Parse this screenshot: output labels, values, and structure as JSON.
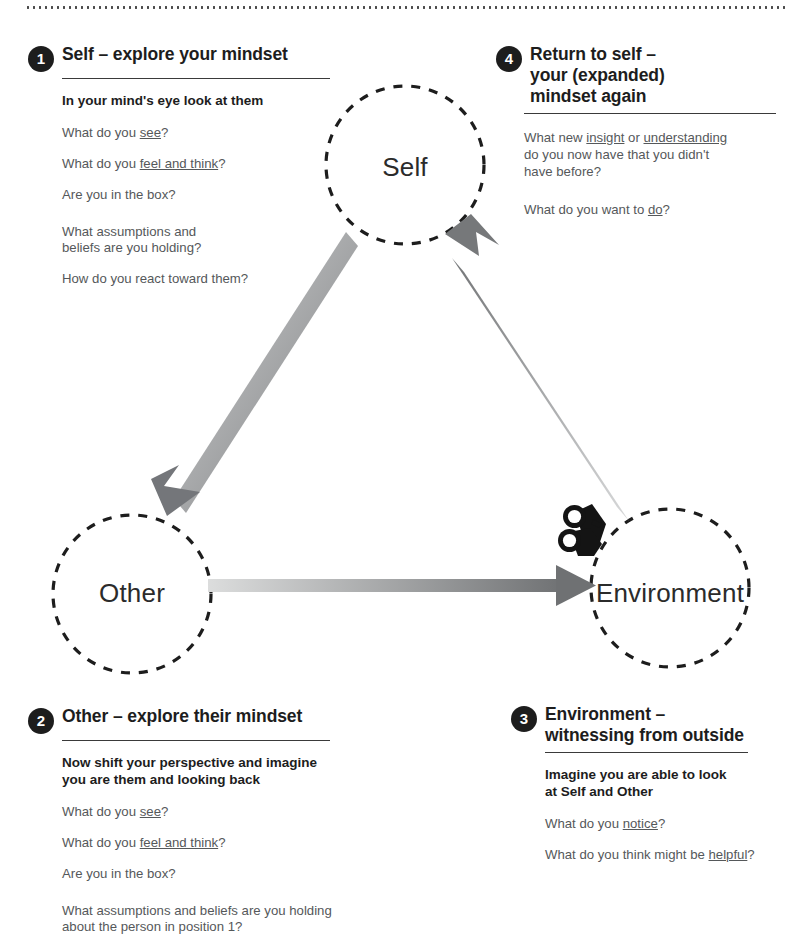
{
  "decor": {
    "top_rule": "dotted-divider"
  },
  "colors": {
    "ink": "#1d1d1d",
    "body_text": "#55585a",
    "node_text": "#2b2b2b",
    "badge_bg": "#1d1d1d",
    "arrow_light": "#d2d3d4",
    "arrow_dark": "#6f7173",
    "circle_stroke": "#1d1d1d"
  },
  "nodes": [
    {
      "id": "self",
      "label": "Self"
    },
    {
      "id": "other",
      "label": "Other"
    },
    {
      "id": "environment",
      "label": "Environment"
    }
  ],
  "arrows": [
    {
      "id": "self-to-other",
      "from": "Self",
      "to": "Other"
    },
    {
      "id": "other-to-environment",
      "from": "Other",
      "to": "Environment"
    },
    {
      "id": "environment-to-self",
      "from": "Environment",
      "to": "Self"
    }
  ],
  "icons": {
    "observer": "binoculars-icon"
  },
  "panels": {
    "p1": {
      "number": "1",
      "title": "Self – explore your mindset",
      "lede": "In your mind's eye look at them",
      "questions": [
        {
          "pre": "What do you ",
          "em": "see",
          "post": "?"
        },
        {
          "pre": "What do you ",
          "em": "feel and think",
          "post": "?"
        },
        {
          "pre": "Are you in the box?",
          "em": "",
          "post": ""
        },
        {
          "pre": "What assumptions and\nbeliefs are you holding?",
          "em": "",
          "post": ""
        },
        {
          "pre": "How do you react toward them?",
          "em": "",
          "post": ""
        }
      ]
    },
    "p2": {
      "number": "2",
      "title": "Other – explore their mindset",
      "lede": "Now shift your perspective and imagine\nyou are them and looking back",
      "questions": [
        {
          "pre": "What do you ",
          "em": "see",
          "post": "?"
        },
        {
          "pre": "What do you ",
          "em": "feel and think",
          "post": "?"
        },
        {
          "pre": "Are you in the box?",
          "em": "",
          "post": ""
        },
        {
          "pre": "What assumptions and beliefs are you holding\nabout the person in position 1?",
          "em": "",
          "post": ""
        }
      ]
    },
    "p3": {
      "number": "3",
      "title": "Environment –\nwitnessing from outside",
      "lede": "Imagine you are able to look\nat Self and Other",
      "questions": [
        {
          "pre": "What do you ",
          "em": "notice",
          "post": "?"
        },
        {
          "pre": "What do you think might be ",
          "em": "helpful",
          "post": "?"
        }
      ]
    },
    "p4": {
      "number": "4",
      "title": "Return to self –\nyour (expanded)\nmindset again",
      "lede": "",
      "questions": [
        {
          "pre": "What new ",
          "em": "insight",
          "post": " or ",
          "em2": "understanding",
          "post2": "\ndo you now have that you didn't\nhave before?"
        },
        {
          "pre": "What do you want to ",
          "em": "do",
          "post": "?"
        }
      ]
    }
  }
}
